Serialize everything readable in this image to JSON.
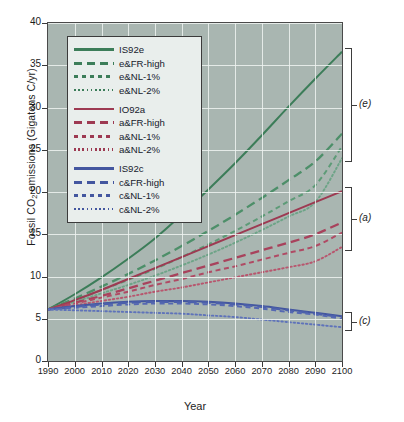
{
  "chart_data": {
    "type": "line",
    "title": "",
    "xlabel": "Year",
    "ylabel": "Fossil CO2 emissions (Gigatons C/yr)",
    "xlim": [
      1990,
      2100
    ],
    "ylim": [
      0,
      40
    ],
    "xticks": [
      1990,
      2000,
      2010,
      2020,
      2030,
      2040,
      2050,
      2060,
      2070,
      2080,
      2090,
      2100
    ],
    "yticks": [
      0,
      5,
      10,
      15,
      20,
      25,
      30,
      35,
      40
    ],
    "grid": true,
    "legend_position": "upper-left-inside",
    "x": [
      1990,
      2000,
      2010,
      2020,
      2030,
      2040,
      2050,
      2060,
      2070,
      2080,
      2090,
      2100
    ],
    "series": [
      {
        "name": "IS92e",
        "group": "e",
        "color": "#3c7d59",
        "style": "solid",
        "values": [
          6.1,
          7.9,
          9.9,
          12.1,
          14.5,
          17.3,
          20.3,
          23.4,
          26.7,
          30.1,
          33.4,
          36.6
        ]
      },
      {
        "name": "e&FR-high",
        "group": "e",
        "color": "#4d8f69",
        "style": "long-dash",
        "values": [
          6.1,
          7.4,
          8.8,
          10.3,
          11.9,
          13.6,
          15.4,
          17.3,
          19.3,
          21.4,
          23.6,
          26.9
        ]
      },
      {
        "name": "e&NL-1%",
        "group": "e",
        "color": "#5d9b77",
        "style": "short-dash",
        "values": [
          6.1,
          7.2,
          8.4,
          9.6,
          10.9,
          12.3,
          13.8,
          15.4,
          17.1,
          18.9,
          20.8,
          25.4
        ]
      },
      {
        "name": "e&NL-2%",
        "group": "e",
        "color": "#6da487",
        "style": "dotted",
        "values": [
          6.1,
          7.0,
          8.0,
          9.0,
          10.1,
          11.3,
          12.6,
          14.0,
          15.5,
          17.1,
          18.8,
          24.0
        ]
      },
      {
        "name": "IO92a",
        "group": "a",
        "color": "#9d3a52",
        "style": "solid",
        "values": [
          6.1,
          7.2,
          8.4,
          9.7,
          11.0,
          12.3,
          13.6,
          14.9,
          16.2,
          17.5,
          18.8,
          20.1
        ]
      },
      {
        "name": "a&FR-high",
        "group": "a",
        "color": "#a8425c",
        "style": "long-dash",
        "values": [
          6.1,
          6.9,
          7.7,
          8.6,
          9.5,
          10.4,
          11.3,
          12.2,
          13.1,
          14.0,
          15.0,
          16.4
        ]
      },
      {
        "name": "a&NL-1%",
        "group": "a",
        "color": "#b04a64",
        "style": "short-dash",
        "values": [
          6.1,
          6.8,
          7.5,
          8.2,
          9.0,
          9.7,
          10.5,
          11.2,
          12.0,
          12.8,
          13.6,
          15.2
        ]
      },
      {
        "name": "a&NL-2%",
        "group": "a",
        "color": "#b8566e",
        "style": "dotted",
        "values": [
          6.1,
          6.6,
          7.1,
          7.6,
          8.2,
          8.7,
          9.3,
          9.9,
          10.5,
          11.1,
          11.8,
          13.5
        ]
      },
      {
        "name": "IS92c",
        "group": "c",
        "color": "#43569f",
        "style": "solid",
        "values": [
          6.1,
          6.5,
          6.8,
          7.0,
          7.1,
          7.1,
          7.0,
          6.8,
          6.5,
          6.1,
          5.7,
          5.3
        ]
      },
      {
        "name": "c&FR-high",
        "group": "c",
        "color": "#4c60aa",
        "style": "long-dash",
        "values": [
          6.1,
          6.4,
          6.7,
          6.9,
          7.0,
          7.0,
          6.9,
          6.7,
          6.4,
          6.0,
          5.6,
          5.2
        ]
      },
      {
        "name": "c&NL-1%",
        "group": "c",
        "color": "#5568b2",
        "style": "short-dash",
        "values": [
          6.1,
          6.3,
          6.5,
          6.7,
          6.8,
          6.8,
          6.7,
          6.5,
          6.2,
          5.8,
          5.5,
          5.0
        ]
      },
      {
        "name": "c&NL-2%",
        "group": "c",
        "color": "#5f73ba",
        "style": "dotted",
        "values": [
          6.1,
          6.0,
          5.9,
          5.8,
          5.7,
          5.6,
          5.4,
          5.2,
          4.9,
          4.6,
          4.3,
          4.0
        ]
      }
    ],
    "annotations": [
      {
        "label": "(e)",
        "group": "e",
        "y_top": 36.6,
        "y_bottom": 24.0
      },
      {
        "label": "(a)",
        "group": "a",
        "y_top": 20.1,
        "y_bottom": 13.5
      },
      {
        "label": "(c)",
        "group": "c",
        "y_top": 5.3,
        "y_bottom": 4.0
      }
    ]
  },
  "legend": {
    "groups": [
      {
        "entries": [
          {
            "label": "IS92e",
            "style": "solid"
          },
          {
            "label": "e&FR-high",
            "style": "long-dash"
          },
          {
            "label": "e&NL-1%",
            "style": "short-dash"
          },
          {
            "label": "e&NL-2%",
            "style": "dotted"
          }
        ]
      },
      {
        "entries": [
          {
            "label": "IO92a",
            "style": "solid"
          },
          {
            "label": "a&FR-high",
            "style": "long-dash"
          },
          {
            "label": "a&NL-1%",
            "style": "short-dash"
          },
          {
            "label": "a&NL-2%",
            "style": "dotted"
          }
        ]
      },
      {
        "entries": [
          {
            "label": "IS92c",
            "style": "solid"
          },
          {
            "label": "c&FR-high",
            "style": "long-dash"
          },
          {
            "label": "c&NL-1%",
            "style": "short-dash"
          },
          {
            "label": "c&NL-2%",
            "style": "dotted"
          }
        ]
      }
    ]
  },
  "colors": {
    "plot_background": "#a9b6b1",
    "gridline": "#eef3f1",
    "axis": "#3a3a3a",
    "green": "#3c7d59",
    "maroon": "#9d3a52",
    "blue": "#43569f",
    "legend_background": "#e9eeec"
  }
}
